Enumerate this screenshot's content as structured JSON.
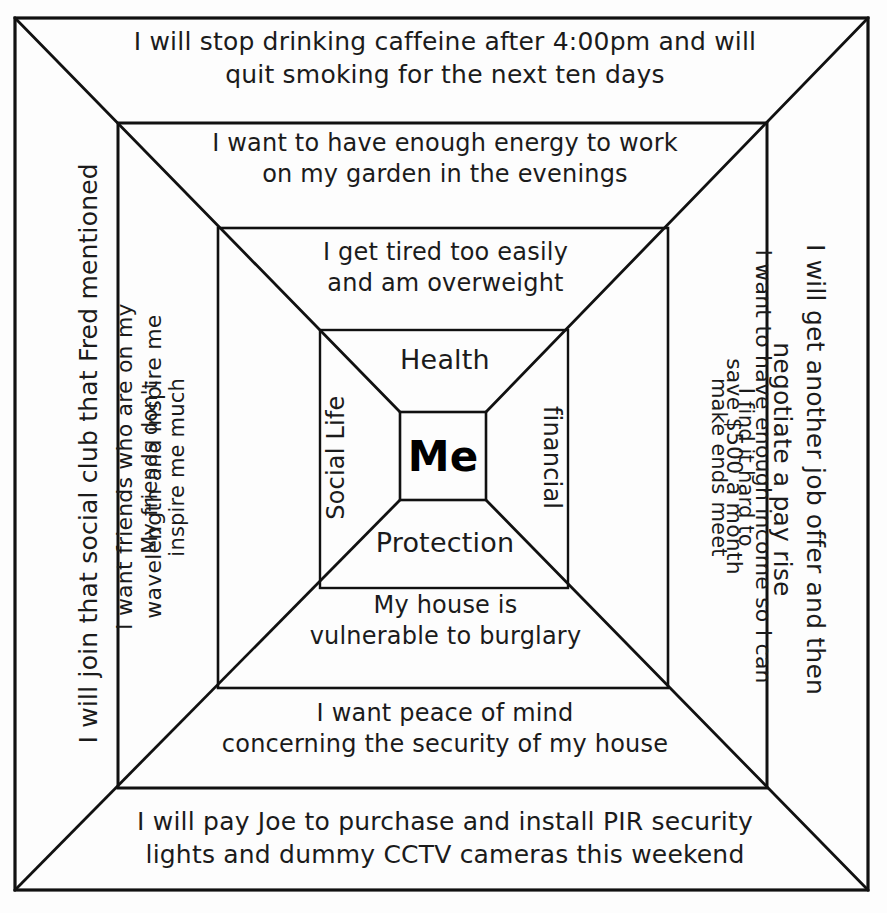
{
  "diagram": {
    "title": "Me",
    "center": {
      "label": "Me"
    },
    "categories": {
      "top": "Health",
      "right": "financial",
      "bottom": "Protection",
      "left": "Social Life"
    },
    "rings": [
      {
        "index": 1,
        "name": "actions",
        "top": "I will stop drinking caffeine after 4:00pm and will\nquit smoking for the next ten days",
        "right": "I will get another job offer and then\nnegotiate a pay rise",
        "bottom": "I will pay Joe to purchase and install PIR security\nlights and dummy CCTV cameras this weekend",
        "left": "I will join that social club that Fred mentioned"
      },
      {
        "index": 2,
        "name": "wants",
        "top": "I want to have enough energy to work\non my garden in the evenings",
        "right": "I want to have enough income so I can\nsave $500 a month",
        "bottom": "I want peace of mind\nconcerning the security of my house",
        "left": "I want friends who are on my\nwavelength and inspire me"
      },
      {
        "index": 3,
        "name": "problems",
        "top": "I get tired too easily\nand am overweight",
        "right": "I find it hard to\nmake ends meet",
        "bottom": "My house is\nvulnerable to burglary",
        "left": "My friends don't\ninspire me much"
      },
      {
        "index": 4,
        "name": "life-areas",
        "top": "Health",
        "right": "financial",
        "bottom": "Protection",
        "left": "Social Life"
      }
    ],
    "style": {
      "ink_color": "#1b1b1b",
      "line_color": "#111111",
      "background_color": "#fdfdfd"
    },
    "geometry": {
      "squares": [
        {
          "x": 15,
          "y": 18,
          "w": 853,
          "h": 872
        },
        {
          "x": 118,
          "y": 123,
          "w": 649,
          "h": 665
        },
        {
          "x": 218,
          "y": 228,
          "w": 450,
          "h": 460
        },
        {
          "x": 320,
          "y": 330,
          "w": 248,
          "h": 258
        },
        {
          "x": 400,
          "y": 412,
          "w": 86,
          "h": 88
        }
      ]
    }
  }
}
